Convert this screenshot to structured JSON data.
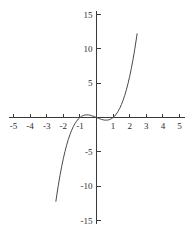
{
  "chart_data": {
    "type": "line",
    "title": "",
    "subtitle": "",
    "xlabel": "",
    "ylabel": "",
    "xlim": [
      -5,
      5
    ],
    "ylim": [
      -15,
      15
    ],
    "grid": false,
    "legend": null,
    "legend_position": "none",
    "annotations": [],
    "x_ticks": [
      -5,
      -4,
      -3,
      -2,
      -1,
      1,
      2,
      3,
      4,
      5
    ],
    "x_tick_labels": [
      "-5",
      "-4",
      "-3",
      "-2",
      "-1",
      "1",
      "2",
      "3",
      "4",
      "5"
    ],
    "y_ticks": [
      15,
      10,
      5,
      -5,
      -10,
      -15
    ],
    "y_tick_labels": [
      "15",
      "10",
      "5",
      "-5",
      "-10",
      "-15"
    ],
    "curve_color": "#4a4a4a",
    "axis_color": "#3a3a3a",
    "series": [
      {
        "name": "cubic",
        "expression": "y = x^3 - x",
        "x": [
          -2.45,
          -2.4,
          -2.3,
          -2.2,
          -2.1,
          -2.0,
          -1.9,
          -1.8,
          -1.7,
          -1.6,
          -1.5,
          -1.4,
          -1.3,
          -1.2,
          -1.1,
          -1.0,
          -0.9,
          -0.8,
          -0.7,
          -0.6,
          -0.5,
          -0.4,
          -0.3,
          -0.2,
          -0.1,
          0.0,
          0.1,
          0.2,
          0.3,
          0.4,
          0.5,
          0.6,
          0.7,
          0.8,
          0.9,
          1.0,
          1.1,
          1.2,
          1.3,
          1.4,
          1.5,
          1.6,
          1.7,
          1.8,
          1.9,
          2.0,
          2.1,
          2.2,
          2.3,
          2.4,
          2.45
        ],
        "y": [
          -12.25,
          -11.42,
          -9.87,
          -8.45,
          -7.16,
          -6.0,
          -4.96,
          -4.03,
          -3.21,
          -2.5,
          -1.88,
          -1.34,
          -0.9,
          -0.53,
          -0.22,
          0.0,
          0.17,
          0.29,
          0.36,
          0.38,
          0.38,
          0.34,
          0.27,
          0.19,
          0.1,
          0.0,
          -0.1,
          -0.19,
          -0.27,
          -0.34,
          -0.38,
          -0.38,
          -0.36,
          -0.29,
          -0.17,
          0.0,
          0.22,
          0.53,
          0.9,
          1.34,
          1.88,
          2.5,
          3.21,
          4.03,
          4.96,
          6.0,
          7.16,
          8.45,
          9.87,
          11.42,
          12.25
        ]
      }
    ]
  }
}
